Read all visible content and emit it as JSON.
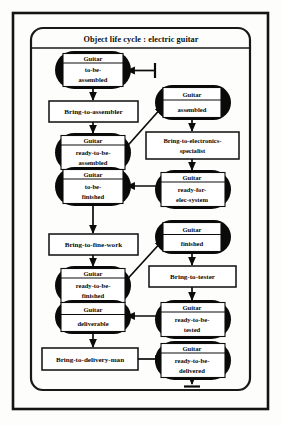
{
  "diagram": {
    "title": "Object life cycle : electric guitar",
    "kind": "object-life-cycle-state-diagram",
    "subject": "electric guitar",
    "states": [
      {
        "id": "to-be-assembled",
        "header": "Guitar",
        "line1": "to-be-",
        "line2": "assembled"
      },
      {
        "id": "ready-to-be-assembled",
        "header": "Guitar",
        "line1": "ready-to-be-",
        "line2": "assembled"
      },
      {
        "id": "to-be-finished",
        "header": "Guitar",
        "line1": "to-be-",
        "line2": "finished"
      },
      {
        "id": "assembled",
        "header": "Guitar",
        "line1": "assembled",
        "line2": ""
      },
      {
        "id": "ready-for-elec-system",
        "header": "Guitar",
        "line1": "ready-for-",
        "line2": "elec-system"
      },
      {
        "id": "ready-to-be-finished",
        "header": "Guitar",
        "line1": "ready-to-be-",
        "line2": "finished"
      },
      {
        "id": "deliverable",
        "header": "Guitar",
        "line1": "deliverable",
        "line2": ""
      },
      {
        "id": "finished",
        "header": "Guitar",
        "line1": "finished",
        "line2": ""
      },
      {
        "id": "ready-to-be-tested",
        "header": "Guitar",
        "line1": "ready-to-be-",
        "line2": "tested"
      },
      {
        "id": "ready-to-be-delivered",
        "header": "Guitar",
        "line1": "ready-to-be-",
        "line2": "delivered"
      }
    ],
    "actions": [
      {
        "id": "bring-to-assembler",
        "line1": "Bring-to-assembler",
        "line2": ""
      },
      {
        "id": "bring-to-electronics-specialist",
        "line1": "Bring-to-electronics-",
        "line2": "specialist"
      },
      {
        "id": "bring-to-fine-work",
        "line1": "Bring-to-fine-work",
        "line2": ""
      },
      {
        "id": "bring-to-tester",
        "line1": "Bring-to-tester",
        "line2": ""
      },
      {
        "id": "bring-to-delivery-man",
        "line1": "Bring-to-delivery-man",
        "line2": ""
      }
    ],
    "transitions": [
      {
        "from": "start-marker",
        "to": "to-be-assembled",
        "shape": "horizontal"
      },
      {
        "from": "to-be-assembled",
        "to": "bring-to-assembler",
        "shape": "vertical"
      },
      {
        "from": "bring-to-assembler",
        "to": "ready-to-be-assembled",
        "shape": "vertical"
      },
      {
        "from": "ready-to-be-assembled",
        "to": "assembled",
        "shape": "diagonal"
      },
      {
        "from": "assembled",
        "to": "bring-to-electronics-specialist",
        "shape": "vertical"
      },
      {
        "from": "bring-to-electronics-specialist",
        "to": "ready-for-elec-system",
        "shape": "vertical"
      },
      {
        "from": "ready-for-elec-system",
        "to": "to-be-finished",
        "shape": "horizontal"
      },
      {
        "from": "to-be-finished",
        "to": "bring-to-fine-work",
        "shape": "vertical"
      },
      {
        "from": "bring-to-fine-work",
        "to": "ready-to-be-finished",
        "shape": "vertical"
      },
      {
        "from": "ready-to-be-finished",
        "to": "finished",
        "shape": "diagonal"
      },
      {
        "from": "finished",
        "to": "bring-to-tester",
        "shape": "vertical"
      },
      {
        "from": "bring-to-tester",
        "to": "ready-to-be-tested",
        "shape": "vertical"
      },
      {
        "from": "ready-to-be-tested",
        "to": "deliverable",
        "shape": "horizontal"
      },
      {
        "from": "deliverable",
        "to": "bring-to-delivery-man",
        "shape": "vertical"
      },
      {
        "from": "bring-to-delivery-man",
        "to": "ready-to-be-delivered",
        "shape": "horizontal"
      },
      {
        "from": "ready-to-be-delivered",
        "to": "end-marker",
        "shape": "vertical"
      }
    ],
    "colors": {
      "ink": "#0b0b0b",
      "state_fill": "#0a0a0a",
      "box_fill": "#ffffff",
      "page": "#fdfdfc"
    }
  }
}
